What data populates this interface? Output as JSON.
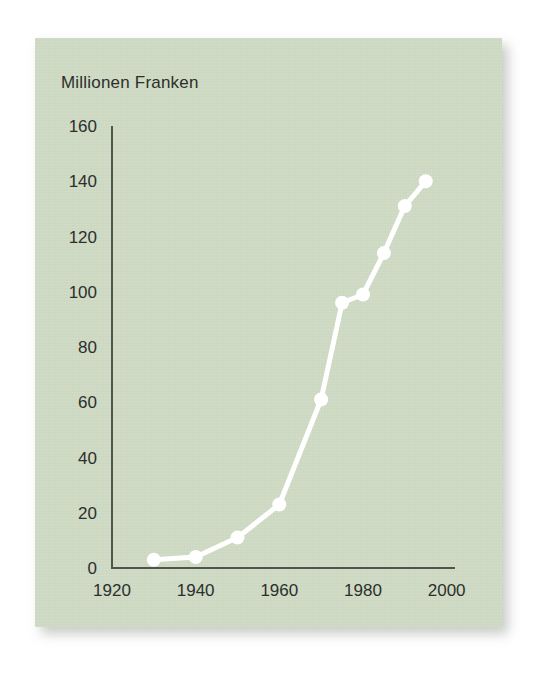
{
  "figure": {
    "title": "Millionen Franken",
    "panel_color": "#ccd8c1",
    "line_color": "#ffffff",
    "axis_color": "#4e554a",
    "text_color": "#2c2f2b",
    "background_color": "#ffffff"
  },
  "chart_data": {
    "type": "line",
    "title": "Millionen Franken",
    "xlabel": "",
    "ylabel": "Millionen Franken",
    "x": [
      1930,
      1940,
      1950,
      1960,
      1970,
      1975,
      1980,
      1985,
      1990,
      1995
    ],
    "values": [
      3,
      4,
      11,
      23,
      61,
      96,
      99,
      114,
      131,
      140
    ],
    "series": [
      {
        "name": "Millionen Franken",
        "values": [
          3,
          4,
          11,
          23,
          61,
          96,
          99,
          114,
          131,
          140
        ]
      }
    ],
    "xlim": [
      1920,
      2002
    ],
    "ylim": [
      0,
      160
    ],
    "xticks": [
      1920,
      1940,
      1960,
      1980,
      2000
    ],
    "xtick_labels": [
      "1920",
      "1940",
      "1960",
      "1980",
      "2000"
    ],
    "yticks": [
      0,
      20,
      40,
      60,
      80,
      100,
      120,
      140,
      160
    ],
    "ytick_labels": [
      "0",
      "20",
      "40",
      "60",
      "80",
      "100",
      "120",
      "140",
      "160"
    ],
    "grid": false,
    "legend": false,
    "markers": "circle",
    "marker_color": "#ffffff",
    "line_color": "#ffffff"
  }
}
